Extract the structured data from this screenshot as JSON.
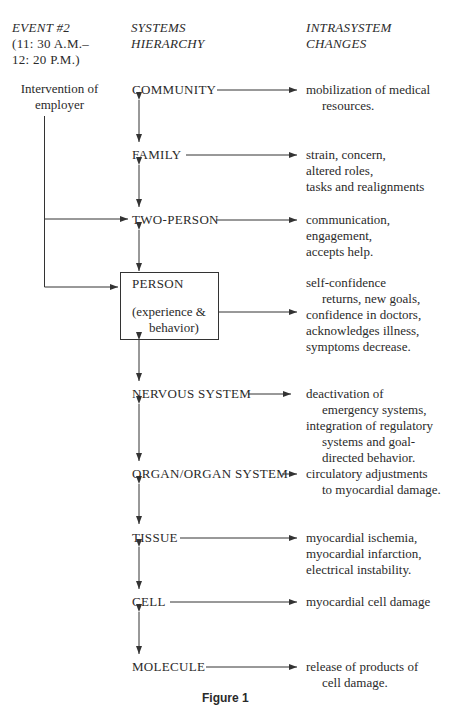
{
  "headers": {
    "event": [
      "EVENT #2",
      "(11: 30 A.M.–",
      "12: 20 P.M.)"
    ],
    "systems": [
      "SYSTEMS",
      "HIERARCHY"
    ],
    "changes": [
      "INTRASYSTEM",
      "CHANGES"
    ]
  },
  "intervention": [
    "Intervention of",
    "employer"
  ],
  "levels": [
    {
      "name": "COMMUNITY",
      "changes": [
        "mobilization of medical",
        "resources."
      ]
    },
    {
      "name": "FAMILY",
      "changes": [
        "strain, concern,",
        "altered roles,",
        "tasks and realignments"
      ]
    },
    {
      "name": "TWO-PERSON",
      "changes": [
        "communication,",
        "engagement,",
        "accepts help."
      ]
    },
    {
      "name": "PERSON",
      "sub": [
        "(experience &",
        "behavior)"
      ],
      "changes": [
        "self-confidence",
        "returns, new goals,",
        "confidence in doctors,",
        "acknowledges illness,",
        "symptoms decrease."
      ]
    },
    {
      "name": "NERVOUS SYSTEM",
      "changes": [
        "deactivation of",
        "emergency systems,",
        "integration of regulatory",
        "systems and goal-",
        "directed behavior."
      ]
    },
    {
      "name": "ORGAN/ORGAN SYSTEM",
      "changes": [
        "circulatory adjustments",
        "to myocardial damage."
      ]
    },
    {
      "name": "TISSUE",
      "changes": [
        "myocardial ischemia,",
        "myocardial infarction,",
        "electrical instability."
      ]
    },
    {
      "name": "CELL",
      "changes": [
        "myocardial cell damage"
      ]
    },
    {
      "name": "MOLECULE",
      "changes": [
        "release of products of",
        "cell damage."
      ]
    }
  ],
  "caption": "Figure 1"
}
